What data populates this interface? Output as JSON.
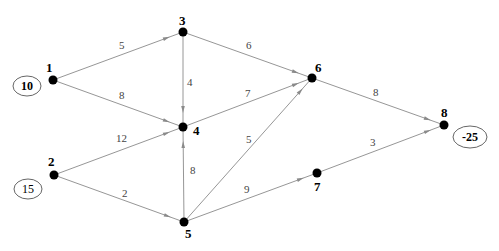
{
  "diagram": {
    "type": "network-flow",
    "nodes": [
      {
        "id": "1",
        "label": "1",
        "x": 53,
        "y": 80,
        "lx": 46,
        "ly": 72
      },
      {
        "id": "2",
        "label": "2",
        "x": 54,
        "y": 175,
        "lx": 48,
        "ly": 166
      },
      {
        "id": "3",
        "label": "3",
        "x": 183,
        "y": 32,
        "lx": 179,
        "ly": 25
      },
      {
        "id": "4",
        "label": "4",
        "x": 183,
        "y": 127,
        "lx": 193,
        "ly": 135
      },
      {
        "id": "5",
        "label": "5",
        "x": 184,
        "y": 222,
        "lx": 185,
        "ly": 238
      },
      {
        "id": "6",
        "label": "6",
        "x": 312,
        "y": 78,
        "lx": 315,
        "ly": 72
      },
      {
        "id": "7",
        "label": "7",
        "x": 317,
        "y": 173,
        "lx": 314,
        "ly": 191
      },
      {
        "id": "8",
        "label": "8",
        "x": 444,
        "y": 125,
        "lx": 441,
        "ly": 117
      }
    ],
    "edges": [
      {
        "from": "1",
        "to": "3",
        "cost": "5",
        "lx": 119,
        "ly": 49
      },
      {
        "from": "1",
        "to": "4",
        "cost": "8",
        "lx": 119,
        "ly": 99
      },
      {
        "from": "3",
        "to": "4",
        "cost": "4",
        "lx": 187,
        "ly": 86
      },
      {
        "from": "3",
        "to": "6",
        "cost": "6",
        "lx": 246,
        "ly": 49
      },
      {
        "from": "2",
        "to": "4",
        "cost": "12",
        "lx": 116,
        "ly": 142
      },
      {
        "from": "2",
        "to": "5",
        "cost": "2",
        "lx": 122,
        "ly": 197
      },
      {
        "from": "5",
        "to": "4",
        "cost": "8",
        "lx": 190,
        "ly": 174
      },
      {
        "from": "4",
        "to": "6",
        "cost": "7",
        "lx": 245,
        "ly": 97
      },
      {
        "from": "5",
        "to": "6",
        "cost": "5",
        "lx": 246,
        "ly": 143
      },
      {
        "from": "5",
        "to": "7",
        "cost": "9",
        "lx": 244,
        "ly": 193
      },
      {
        "from": "6",
        "to": "8",
        "cost": "8",
        "lx": 373,
        "ly": 96
      },
      {
        "from": "7",
        "to": "8",
        "cost": "3",
        "lx": 370,
        "ly": 146
      }
    ],
    "supplies": [
      {
        "node": "1",
        "value": "10",
        "cx": 27,
        "cy": 86,
        "rx": 14,
        "ry": 10,
        "bold": true
      },
      {
        "node": "2",
        "value": "15",
        "cx": 28,
        "cy": 189,
        "rx": 14,
        "ry": 10,
        "bold": false
      },
      {
        "node": "8",
        "value": "-25",
        "cx": 470,
        "cy": 137,
        "rx": 17,
        "ry": 11,
        "bold": true
      }
    ]
  }
}
